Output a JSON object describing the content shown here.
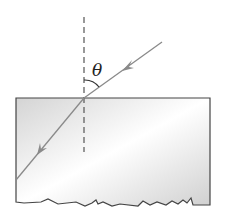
{
  "diagram": {
    "angle_label": "θ",
    "colors": {
      "ray": "#8a8a8a",
      "block_border": "#444444",
      "block_fill_light": "#ffffff",
      "block_fill_dark": "#d9d9d9",
      "normal_line": "#555555",
      "label": "#222222"
    },
    "elements": {
      "normal": "dashed normal line",
      "incident_ray": "incident ray with arrow",
      "refracted_ray": "refracted ray with arrow",
      "block": "transparent block with torn bottom edge",
      "angle_arc": "angle theta between normal and incident ray"
    }
  }
}
